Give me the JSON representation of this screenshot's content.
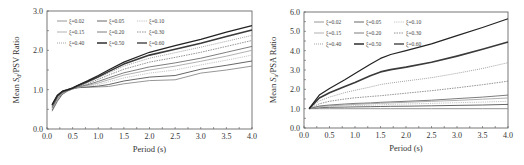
{
  "chart_data": [
    {
      "type": "line",
      "title": "",
      "xlabel": "Period (s)",
      "ylabel": "Mean Sd/PSV Ratio",
      "ylabel_parts": {
        "pre": "Mean ",
        "sym": "S",
        "sub": "d",
        "post": "/PSV Ratio"
      },
      "xlim": [
        0,
        4
      ],
      "ylim": [
        0,
        3
      ],
      "x_ticks": [
        "0.0",
        "0.5",
        "1.0",
        "1.5",
        "2.0",
        "2.5",
        "3.0",
        "3.5",
        "4.0"
      ],
      "y_ticks": [
        "0.0",
        "1.0",
        "2.0",
        "3.0"
      ],
      "grid": false,
      "legend_position": "upper-left",
      "x": [
        0.1,
        0.2,
        0.3,
        0.4,
        0.5,
        0.6,
        0.8,
        1.0,
        1.2,
        1.5,
        2.0,
        2.5,
        3.0,
        3.5,
        4.0
      ],
      "series": [
        {
          "name": "ξ=0.02",
          "values": [
            0.45,
            0.7,
            0.88,
            0.96,
            1.02,
            1.05,
            1.06,
            1.07,
            1.08,
            1.15,
            1.23,
            1.25,
            1.42,
            1.5,
            1.6
          ]
        },
        {
          "name": "ξ=0.05",
          "values": [
            0.48,
            0.72,
            0.89,
            0.97,
            1.02,
            1.05,
            1.07,
            1.09,
            1.13,
            1.22,
            1.32,
            1.36,
            1.52,
            1.62,
            1.73
          ]
        },
        {
          "name": "ξ=0.10",
          "values": [
            0.5,
            0.74,
            0.9,
            0.97,
            1.02,
            1.06,
            1.09,
            1.13,
            1.2,
            1.3,
            1.42,
            1.5,
            1.63,
            1.75,
            1.88
          ]
        },
        {
          "name": "ξ=0.15",
          "values": [
            0.52,
            0.76,
            0.91,
            0.97,
            1.03,
            1.06,
            1.11,
            1.17,
            1.25,
            1.37,
            1.5,
            1.6,
            1.72,
            1.85,
            2.0
          ]
        },
        {
          "name": "ξ=0.20",
          "values": [
            0.54,
            0.78,
            0.92,
            0.98,
            1.03,
            1.07,
            1.13,
            1.21,
            1.3,
            1.43,
            1.58,
            1.68,
            1.8,
            1.95,
            2.1
          ]
        },
        {
          "name": "ξ=0.30",
          "values": [
            0.56,
            0.8,
            0.93,
            0.98,
            1.03,
            1.08,
            1.16,
            1.26,
            1.37,
            1.52,
            1.7,
            1.82,
            1.95,
            2.1,
            2.25
          ]
        },
        {
          "name": "ξ=0.40",
          "values": [
            0.58,
            0.82,
            0.94,
            0.99,
            1.03,
            1.09,
            1.19,
            1.3,
            1.42,
            1.6,
            1.8,
            1.94,
            2.08,
            2.23,
            2.38
          ]
        },
        {
          "name": "ξ=0.50",
          "values": [
            0.6,
            0.84,
            0.95,
            0.99,
            1.04,
            1.1,
            1.21,
            1.33,
            1.46,
            1.65,
            1.88,
            2.03,
            2.18,
            2.35,
            2.52
          ]
        },
        {
          "name": "ξ=0.60",
          "values": [
            0.62,
            0.86,
            0.96,
            1.0,
            1.04,
            1.11,
            1.23,
            1.36,
            1.5,
            1.7,
            1.95,
            2.12,
            2.28,
            2.46,
            2.63
          ]
        }
      ]
    },
    {
      "type": "line",
      "title": "",
      "xlabel": "Period (s)",
      "ylabel": "Mean Sa/PSA Ratio",
      "ylabel_parts": {
        "pre": "Mean ",
        "sym": "S",
        "sub": "a",
        "post": "/PSA Ratio"
      },
      "xlim": [
        0,
        4
      ],
      "ylim": [
        0,
        6
      ],
      "x_ticks": [
        "0.0",
        "0.5",
        "1.0",
        "1.5",
        "2.0",
        "2.5",
        "3.0",
        "3.5",
        "4.0"
      ],
      "y_ticks": [
        "0.0",
        "1.0",
        "2.0",
        "3.0",
        "4.0",
        "5.0",
        "6.0"
      ],
      "grid": false,
      "legend_position": "upper-left",
      "x": [
        0.1,
        0.3,
        0.5,
        0.8,
        1.0,
        1.3,
        1.5,
        1.7,
        2.0,
        2.5,
        3.0,
        3.5,
        4.0
      ],
      "series": [
        {
          "name": "ξ=0.02",
          "values": [
            1.0,
            1.0,
            1.0,
            1.0,
            1.0,
            1.0,
            1.0,
            1.0,
            1.0,
            1.0,
            1.0,
            1.0,
            1.0
          ]
        },
        {
          "name": "ξ=0.05",
          "values": [
            1.0,
            1.05,
            1.07,
            1.08,
            1.09,
            1.1,
            1.11,
            1.12,
            1.13,
            1.15,
            1.17,
            1.19,
            1.22
          ]
        },
        {
          "name": "ξ=0.10",
          "values": [
            1.0,
            1.08,
            1.11,
            1.14,
            1.16,
            1.18,
            1.2,
            1.22,
            1.24,
            1.27,
            1.31,
            1.34,
            1.38
          ]
        },
        {
          "name": "ξ=0.15",
          "values": [
            1.0,
            1.11,
            1.15,
            1.19,
            1.22,
            1.25,
            1.28,
            1.3,
            1.33,
            1.38,
            1.43,
            1.49,
            1.55
          ]
        },
        {
          "name": "ξ=0.20",
          "values": [
            1.0,
            1.14,
            1.19,
            1.24,
            1.27,
            1.3,
            1.33,
            1.35,
            1.38,
            1.44,
            1.52,
            1.6,
            1.7
          ]
        },
        {
          "name": "ξ=0.30",
          "values": [
            1.0,
            1.25,
            1.38,
            1.5,
            1.56,
            1.63,
            1.67,
            1.72,
            1.8,
            1.93,
            2.08,
            2.24,
            2.42
          ]
        },
        {
          "name": "ξ=0.40",
          "values": [
            1.0,
            1.4,
            1.6,
            1.83,
            1.95,
            2.12,
            2.25,
            2.33,
            2.43,
            2.6,
            2.83,
            3.08,
            3.38
          ]
        },
        {
          "name": "ξ=0.50",
          "values": [
            1.0,
            1.55,
            1.82,
            2.15,
            2.35,
            2.7,
            2.9,
            3.02,
            3.15,
            3.4,
            3.72,
            4.07,
            4.45
          ]
        },
        {
          "name": "ξ=0.60",
          "values": [
            1.0,
            1.7,
            2.05,
            2.5,
            2.82,
            3.3,
            3.6,
            3.8,
            4.0,
            4.35,
            4.78,
            5.2,
            5.65
          ]
        }
      ]
    }
  ],
  "styles": {
    "series": [
      {
        "color": "#8a8a8a",
        "width": 0.9,
        "dash": ""
      },
      {
        "color": "#555555",
        "width": 0.9,
        "dash": ""
      },
      {
        "color": "#bdbdbd",
        "width": 0.9,
        "dash": "1.2,1"
      },
      {
        "color": "#a8a8a8",
        "width": 0.9,
        "dash": ""
      },
      {
        "color": "#6e6e6e",
        "width": 0.9,
        "dash": ""
      },
      {
        "color": "#777777",
        "width": 0.8,
        "dash": "1.5,1"
      },
      {
        "color": "#9a9a9a",
        "width": 0.9,
        "dash": "1,1"
      },
      {
        "color": "#3a3a3a",
        "width": 1.6,
        "dash": ""
      },
      {
        "color": "#222222",
        "width": 1.2,
        "dash": ""
      }
    ],
    "axis_color": "#555555",
    "text_color": "#333333"
  }
}
